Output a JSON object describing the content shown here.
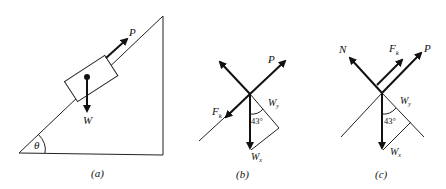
{
  "figures": [
    {
      "id": "a",
      "caption": "(a)",
      "labels": {
        "force_applied": "P",
        "weight": "W",
        "angle": "θ"
      }
    },
    {
      "id": "b",
      "caption": "(b)",
      "labels": {
        "force_applied": "P",
        "friction": "F",
        "friction_sub": "k",
        "component_slope": "W",
        "component_slope_sub": "y",
        "weight_vec": "W",
        "weight_vec_sub": "x",
        "angle": "43°"
      }
    },
    {
      "id": "c",
      "caption": "(c)",
      "labels": {
        "normal": "N",
        "force_applied": "P",
        "friction": "F",
        "friction_sub": "k",
        "component_slope": "W",
        "component_slope_sub": "y",
        "weight_vec": "W",
        "weight_vec_sub": "x",
        "angle": "43°"
      }
    }
  ],
  "colors": {
    "ink": "#111111",
    "background": "#ffffff"
  }
}
